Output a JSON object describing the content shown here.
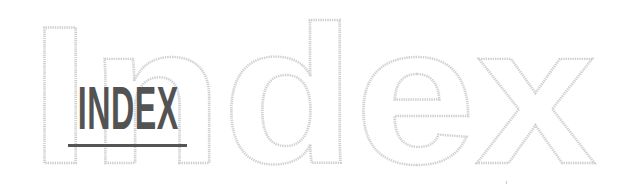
{
  "logo": {
    "outline_word": "Index",
    "label": "INDEX",
    "colors": {
      "background": "#ffffff",
      "outline_stroke": "#cfcfcf",
      "label_text": "#535353",
      "underline": "#555555"
    }
  }
}
